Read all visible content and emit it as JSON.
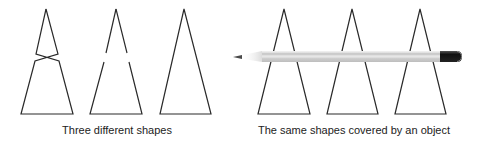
{
  "panels": [
    {
      "caption": "Three different shapes",
      "shapes": [
        {
          "name": "crossed-shape"
        },
        {
          "name": "broken-triangle"
        },
        {
          "name": "complete-triangle"
        }
      ]
    },
    {
      "caption": "The same shapes covered by an object",
      "occluder": "pencil"
    }
  ],
  "colors": {
    "stroke": "#2a2a2a",
    "pencil_body": "#d9d9d9",
    "pencil_eraser": "#1a1a1a",
    "pencil_tip": "#555555"
  }
}
